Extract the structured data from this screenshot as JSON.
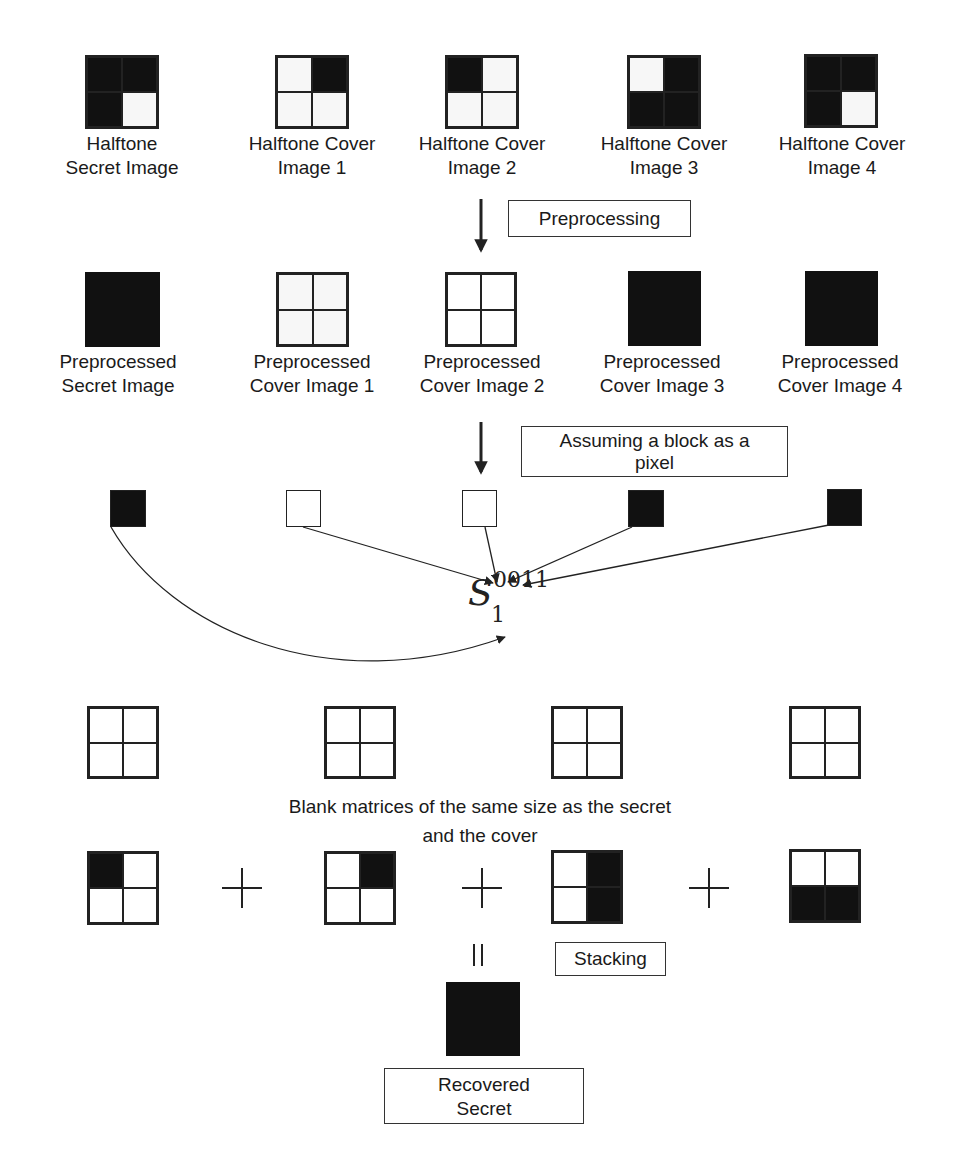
{
  "stage1": {
    "items": [
      {
        "label_line1": "Halftone",
        "label_line2": "Secret Image",
        "cells": [
          "b",
          "b",
          "b",
          "w"
        ]
      },
      {
        "label_line1": "Halftone Cover",
        "label_line2": "Image 1",
        "cells": [
          "w",
          "b",
          "w",
          "w"
        ]
      },
      {
        "label_line1": "Halftone Cover",
        "label_line2": "Image 2",
        "cells": [
          "b",
          "w",
          "w",
          "w"
        ]
      },
      {
        "label_line1": "Halftone Cover",
        "label_line2": "Image 3",
        "cells": [
          "w",
          "b",
          "b",
          "b"
        ]
      },
      {
        "label_line1": "Halftone Cover",
        "label_line2": "Image 4",
        "cells": [
          "b",
          "b",
          "b",
          "w"
        ]
      }
    ]
  },
  "step1": {
    "label": "Preprocessing"
  },
  "stage2": {
    "items": [
      {
        "label_line1": "Preprocessed",
        "label_line2": "Secret Image",
        "fill": "black"
      },
      {
        "label_line1": "Preprocessed",
        "label_line2": "Cover Image 1",
        "fill": "white"
      },
      {
        "label_line1": "Preprocessed",
        "label_line2": "Cover Image 2",
        "fill": "white"
      },
      {
        "label_line1": "Preprocessed",
        "label_line2": "Cover Image 3",
        "fill": "black"
      },
      {
        "label_line1": "Preprocessed",
        "label_line2": "Cover Image 4",
        "fill": "black"
      }
    ]
  },
  "step2": {
    "label_line1": "Assuming a block as a",
    "label_line2": "pixel"
  },
  "pixels": [
    "black",
    "white",
    "white",
    "black",
    "black"
  ],
  "matrix_symbol": {
    "base": "S",
    "subscript": "1",
    "superscript": "0011"
  },
  "blank_caption": {
    "line1": "Blank matrices of the same size as the secret",
    "line2": "and the cover"
  },
  "shares": [
    {
      "cells": [
        "b",
        "w",
        "w",
        "w"
      ]
    },
    {
      "cells": [
        "w",
        "b",
        "w",
        "w"
      ]
    },
    {
      "cells": [
        "w",
        "b",
        "w",
        "b"
      ]
    },
    {
      "cells": [
        "w",
        "w",
        "b",
        "b"
      ]
    }
  ],
  "operators": {
    "plus": "+",
    "equals": "="
  },
  "step3": {
    "label": "Stacking"
  },
  "result": {
    "label_line1": "Recovered",
    "label_line2": "Secret",
    "fill": "black"
  }
}
